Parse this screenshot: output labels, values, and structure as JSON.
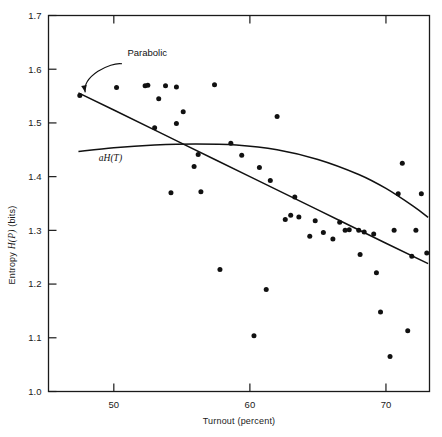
{
  "chart_data": {
    "type": "scatter",
    "title": "",
    "xlabel": "Turnout (percent)",
    "ylabel": "Entropy H(P) (bits)",
    "ylabel_parts": {
      "pre": "Entropy ",
      "italic": "H(P)",
      "post": " (bits)"
    },
    "xlim": [
      45.2,
      73.2
    ],
    "ylim": [
      1.0,
      1.7
    ],
    "xticks": [
      50,
      60,
      70
    ],
    "xticklabels": [
      "50",
      "60",
      "70"
    ],
    "yticks": [
      1.0,
      1.1,
      1.2,
      1.3,
      1.4,
      1.5,
      1.6,
      1.7
    ],
    "yticklabels": [
      "1.0",
      "1.1",
      "1.2",
      "1.3",
      "1.4",
      "1.5",
      "1.6",
      "1.7"
    ],
    "grid": false,
    "legend": "none",
    "frame": "box",
    "points": [
      [
        47.5,
        1.551
      ],
      [
        50.2,
        1.566
      ],
      [
        52.3,
        1.569
      ],
      [
        53.0,
        1.491
      ],
      [
        52.5,
        1.57
      ],
      [
        53.8,
        1.569
      ],
      [
        54.6,
        1.567
      ],
      [
        54.6,
        1.499
      ],
      [
        53.3,
        1.545
      ],
      [
        55.1,
        1.521
      ],
      [
        56.2,
        1.441
      ],
      [
        56.4,
        1.372
      ],
      [
        55.9,
        1.419
      ],
      [
        57.4,
        1.571
      ],
      [
        57.8,
        1.227
      ],
      [
        54.2,
        1.37
      ],
      [
        58.6,
        1.462
      ],
      [
        59.4,
        1.44
      ],
      [
        60.7,
        1.417
      ],
      [
        61.5,
        1.393
      ],
      [
        62.0,
        1.512
      ],
      [
        62.6,
        1.32
      ],
      [
        63.0,
        1.328
      ],
      [
        63.6,
        1.325
      ],
      [
        63.3,
        1.362
      ],
      [
        64.4,
        1.289
      ],
      [
        64.8,
        1.318
      ],
      [
        65.4,
        1.296
      ],
      [
        66.6,
        1.315
      ],
      [
        67.0,
        1.3
      ],
      [
        66.1,
        1.284
      ],
      [
        67.3,
        1.301
      ],
      [
        68.0,
        1.3
      ],
      [
        68.4,
        1.297
      ],
      [
        68.1,
        1.255
      ],
      [
        69.1,
        1.293
      ],
      [
        69.3,
        1.221
      ],
      [
        69.6,
        1.148
      ],
      [
        70.3,
        1.065
      ],
      [
        70.6,
        1.3
      ],
      [
        70.9,
        1.368
      ],
      [
        71.2,
        1.425
      ],
      [
        71.6,
        1.113
      ],
      [
        71.9,
        1.252
      ],
      [
        72.2,
        1.3
      ],
      [
        72.6,
        1.368
      ],
      [
        73.0,
        1.258
      ],
      [
        61.2,
        1.19
      ],
      [
        60.3,
        1.104
      ]
    ],
    "series_lines": [
      {
        "name": "Parabolic",
        "label": "Parabolic",
        "label_pos": [
          51.0,
          1.625
        ],
        "arrow_from": [
          50.6,
          1.61
        ],
        "arrow_to": [
          47.9,
          1.557
        ],
        "path": [
          [
            47.4,
            1.556
          ],
          [
            50,
            1.524
          ],
          [
            55,
            1.462
          ],
          [
            60,
            1.4
          ],
          [
            65,
            1.338
          ],
          [
            70,
            1.276
          ],
          [
            73.1,
            1.238
          ]
        ]
      },
      {
        "name": "aH(T)",
        "label": "aH(T)",
        "label_pos": [
          48.9,
          1.43
        ],
        "path": [
          [
            47.4,
            1.447
          ],
          [
            50,
            1.454
          ],
          [
            53,
            1.459
          ],
          [
            56,
            1.461
          ],
          [
            59,
            1.459
          ],
          [
            62,
            1.45
          ],
          [
            65,
            1.432
          ],
          [
            68,
            1.404
          ],
          [
            70,
            1.378
          ],
          [
            72,
            1.345
          ],
          [
            73.1,
            1.324
          ]
        ]
      }
    ]
  },
  "axes": {
    "x_axis_name": "Turnout (percent)",
    "y_axis_name": "Entropy H(P) (bits)"
  }
}
